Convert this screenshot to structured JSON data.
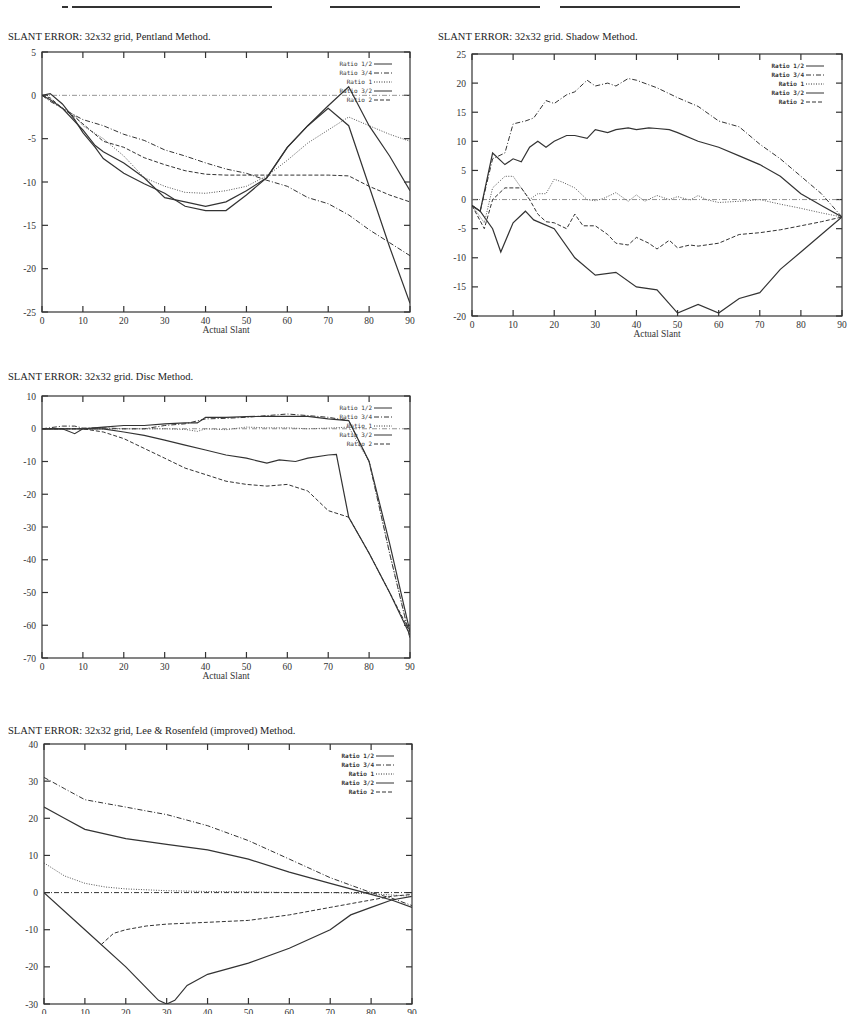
{
  "page": {
    "header_fragment": "...operated ... ... ... ... ... ... ..."
  },
  "chart_data": [
    {
      "id": "pentland",
      "type": "line",
      "title": "SLANT ERROR:  32x32 grid, Pentland Method.",
      "xlabel": "Actual Slant",
      "ylabel": "",
      "xlim": [
        0,
        90
      ],
      "ylim": [
        -25,
        5
      ],
      "xticks": [
        0,
        10,
        20,
        30,
        40,
        50,
        60,
        70,
        80,
        90
      ],
      "yticks": [
        5,
        0,
        -5,
        -10,
        -15,
        -20,
        -25
      ],
      "grid": false,
      "legend_position": "top-right",
      "series": [
        {
          "name": "Ratio 1/2",
          "style": "solid",
          "x": [
            0,
            2,
            5,
            8,
            10,
            13,
            15,
            20,
            25,
            30,
            35,
            40,
            45,
            50,
            55,
            60,
            65,
            70,
            75,
            80,
            85,
            90
          ],
          "y": [
            0,
            -0.5,
            -1.5,
            -3,
            -4,
            -5.8,
            -6.5,
            -7.8,
            -9.5,
            -11.8,
            -12.3,
            -12.8,
            -12.3,
            -11,
            -9.5,
            -6,
            -3.5,
            -1.5,
            -3.5,
            -10.5,
            -17.5,
            -24
          ]
        },
        {
          "name": "Ratio 3/4",
          "style": "dash-dot",
          "x": [
            0,
            2,
            5,
            8,
            10,
            15,
            20,
            25,
            30,
            35,
            40,
            45,
            50,
            55,
            60,
            65,
            70,
            75,
            80,
            85,
            90
          ],
          "y": [
            0,
            -0.7,
            -1.5,
            -2.3,
            -2.8,
            -3.5,
            -4.5,
            -5.2,
            -6.3,
            -7,
            -7.8,
            -8.5,
            -9,
            -9.8,
            -10.5,
            -11.8,
            -12.5,
            -13.8,
            -15.5,
            -17,
            -18.5
          ]
        },
        {
          "name": "Ratio 1",
          "style": "dotted",
          "x": [
            0,
            2,
            5,
            8,
            10,
            15,
            20,
            25,
            30,
            35,
            40,
            45,
            50,
            55,
            60,
            65,
            70,
            75,
            80,
            85,
            90
          ],
          "y": [
            0,
            -0.5,
            -1.5,
            -2.3,
            -3.5,
            -5,
            -7,
            -9.5,
            -10.5,
            -11.2,
            -11.3,
            -11,
            -10.5,
            -9.3,
            -7.5,
            -5.5,
            -4,
            -2.5,
            -3.5,
            -4.5,
            -5.3
          ]
        },
        {
          "name": "Ratio 3/2",
          "style": "solid",
          "x": [
            0,
            2,
            5,
            8,
            10,
            13,
            15,
            20,
            25,
            30,
            35,
            40,
            45,
            50,
            55,
            60,
            65,
            70,
            75,
            80,
            85,
            90
          ],
          "y": [
            0,
            0.2,
            -1,
            -2.8,
            -4.3,
            -6,
            -7.3,
            -9,
            -10.2,
            -11.3,
            -12.8,
            -13.3,
            -13.3,
            -11.5,
            -9.5,
            -6,
            -3.5,
            -1.2,
            1,
            -3.5,
            -7,
            -11
          ]
        },
        {
          "name": "Ratio 2",
          "style": "dashed",
          "x": [
            0,
            2,
            5,
            8,
            10,
            15,
            20,
            25,
            30,
            35,
            40,
            45,
            50,
            55,
            60,
            65,
            70,
            75,
            80,
            85,
            90
          ],
          "y": [
            0,
            -0.3,
            -1.5,
            -2.5,
            -3.3,
            -5.3,
            -6,
            -7.2,
            -8,
            -8.7,
            -9.1,
            -9.2,
            -9.2,
            -9.2,
            -9.2,
            -9.2,
            -9.2,
            -9.3,
            -10.5,
            -11.5,
            -12.3
          ]
        }
      ]
    },
    {
      "id": "shadow",
      "type": "line",
      "title": "SLANT ERROR:  32x32 grid. Shadow Method.",
      "xlabel": "Actual Slant",
      "ylabel": "",
      "xlim": [
        0,
        90
      ],
      "ylim": [
        -20,
        25
      ],
      "xticks": [
        0,
        10,
        20,
        30,
        40,
        50,
        60,
        70,
        80,
        90
      ],
      "yticks": [
        25,
        20,
        15,
        10,
        5,
        0,
        -5,
        -10,
        -15,
        -20
      ],
      "grid": false,
      "legend_position": "top-right",
      "series": [
        {
          "name": "Ratio 1/2",
          "style": "solid",
          "x": [
            0,
            2,
            5,
            7,
            10,
            13,
            15,
            20,
            25,
            30,
            35,
            40,
            45,
            50,
            55,
            60,
            65,
            70,
            75,
            80,
            85,
            90
          ],
          "y": [
            -1,
            -2,
            -5,
            -9,
            -4,
            -2,
            -3.5,
            -5,
            -10,
            -13,
            -12.5,
            -15,
            -15.5,
            -19.5,
            -18,
            -19.5,
            -17,
            -16,
            -12,
            -9,
            -6,
            -3
          ]
        },
        {
          "name": "Ratio 3/4",
          "style": "dash-dot",
          "x": [
            0,
            2,
            5,
            8,
            10,
            13,
            15,
            18,
            20,
            23,
            25,
            28,
            30,
            33,
            35,
            38,
            40,
            45,
            50,
            55,
            60,
            65,
            70,
            75,
            80,
            85,
            90
          ],
          "y": [
            -1,
            -2,
            7,
            8,
            13,
            13.5,
            14,
            17,
            16.5,
            18,
            18.5,
            20.5,
            19.5,
            20,
            19.5,
            20.8,
            20.5,
            19.2,
            17.5,
            16,
            13.5,
            12.5,
            9.5,
            7,
            4,
            1,
            -3
          ]
        },
        {
          "name": "Ratio 1",
          "style": "dotted",
          "x": [
            0,
            3,
            5,
            8,
            10,
            12,
            14,
            16,
            18,
            20,
            22,
            25,
            28,
            30,
            32,
            35,
            38,
            40,
            42,
            45,
            48,
            50,
            53,
            55,
            57,
            60,
            65,
            70,
            75,
            80,
            85,
            90
          ],
          "y": [
            -1,
            -4,
            2,
            4,
            4,
            2,
            0,
            1,
            1,
            3.5,
            3,
            2,
            0,
            -0.2,
            0.2,
            1.2,
            -0.3,
            0.8,
            -0.3,
            0.7,
            0,
            0.5,
            -0.1,
            0.7,
            0,
            -0.5,
            -0.3,
            0,
            -0.8,
            -1.5,
            -2.3,
            -3
          ]
        },
        {
          "name": "Ratio 3/2",
          "style": "solid",
          "x": [
            0,
            2,
            5,
            8,
            10,
            12,
            14,
            16,
            18,
            20,
            23,
            25,
            28,
            30,
            33,
            35,
            38,
            40,
            43,
            45,
            48,
            50,
            55,
            60,
            65,
            70,
            75,
            80,
            85,
            90
          ],
          "y": [
            -1,
            -2,
            8,
            6,
            7,
            6.5,
            9,
            10,
            9,
            10,
            11,
            11,
            10.5,
            12,
            11.5,
            12,
            12.3,
            12,
            12.3,
            12.2,
            12,
            11.5,
            10,
            9,
            7.5,
            6,
            4,
            1,
            -1,
            -3
          ]
        },
        {
          "name": "Ratio 2",
          "style": "dashed",
          "x": [
            0,
            3,
            5,
            8,
            10,
            12,
            14,
            16,
            18,
            20,
            23,
            25,
            27,
            30,
            33,
            35,
            38,
            40,
            43,
            45,
            48,
            50,
            53,
            55,
            60,
            65,
            70,
            75,
            80,
            85,
            90
          ],
          "y": [
            -1,
            -5,
            0,
            2,
            2,
            2,
            0,
            -2.5,
            -3.8,
            -4,
            -5,
            -2.5,
            -4.5,
            -4.5,
            -6,
            -7.5,
            -7.8,
            -6.5,
            -7.5,
            -8.5,
            -7,
            -8.3,
            -7.8,
            -8,
            -7.5,
            -6,
            -5.7,
            -5.2,
            -4.5,
            -3.8,
            -3
          ]
        }
      ]
    },
    {
      "id": "disc",
      "type": "line",
      "title": "SLANT ERROR:  32x32 grid. Disc Method.",
      "xlabel": "Actual Slant",
      "ylabel": "",
      "xlim": [
        0,
        90
      ],
      "ylim": [
        -70,
        10
      ],
      "xticks": [
        0,
        10,
        20,
        30,
        40,
        50,
        60,
        70,
        80,
        90
      ],
      "yticks": [
        10,
        0,
        -10,
        -20,
        -30,
        -40,
        -50,
        -60,
        -70
      ],
      "grid": false,
      "legend_position": "top-right",
      "series": [
        {
          "name": "Ratio 1/2",
          "style": "solid",
          "x": [
            0,
            5,
            8,
            10,
            15,
            20,
            25,
            30,
            35,
            38,
            40,
            45,
            50,
            55,
            60,
            65,
            70,
            75,
            80,
            85,
            90
          ],
          "y": [
            0,
            0,
            -1.5,
            0,
            0.5,
            1,
            1,
            1.5,
            1.8,
            1.8,
            3.5,
            3.5,
            3.7,
            3.8,
            3.8,
            3.8,
            3,
            2.5,
            -10,
            -35,
            -62
          ]
        },
        {
          "name": "Ratio 3/4",
          "style": "dash-dot",
          "x": [
            0,
            5,
            8,
            10,
            15,
            20,
            25,
            30,
            35,
            40,
            45,
            50,
            55,
            60,
            65,
            70,
            75,
            80,
            85,
            90
          ],
          "y": [
            0,
            0.8,
            0.8,
            0.2,
            0.3,
            0,
            0,
            1,
            1.5,
            3,
            3.2,
            3.5,
            4,
            4.5,
            4,
            3.5,
            2.5,
            -10,
            -38,
            -64
          ]
        },
        {
          "name": "Ratio 1",
          "style": "dotted",
          "x": [
            0,
            5,
            10,
            15,
            20,
            25,
            30,
            35,
            38,
            40,
            45,
            50,
            55,
            60,
            65,
            70,
            75,
            80,
            85,
            90
          ],
          "y": [
            0,
            0,
            0,
            0,
            0,
            0,
            0,
            -0.2,
            -0.8,
            0,
            -0.3,
            0.5,
            0.3,
            0.3,
            0,
            0.2,
            0.5,
            -10,
            -38,
            -64
          ]
        },
        {
          "name": "Ratio 3/2",
          "style": "solid",
          "x": [
            0,
            5,
            10,
            15,
            20,
            25,
            30,
            35,
            40,
            45,
            50,
            55,
            58,
            62,
            65,
            70,
            72,
            75,
            80,
            85,
            90
          ],
          "y": [
            0,
            0,
            0,
            0,
            -1,
            -2,
            -3.5,
            -5,
            -6.5,
            -8,
            -9,
            -10.5,
            -9.5,
            -10,
            -9,
            -8,
            -7.8,
            -27,
            -38,
            -50,
            -63
          ]
        },
        {
          "name": "Ratio 2",
          "style": "dashed",
          "x": [
            0,
            5,
            10,
            15,
            20,
            25,
            30,
            35,
            40,
            45,
            50,
            55,
            60,
            65,
            70,
            75,
            80,
            85,
            90
          ],
          "y": [
            0,
            0,
            0,
            -1,
            -3,
            -6,
            -9,
            -12,
            -14,
            -16,
            -17,
            -17.5,
            -17,
            -19,
            -25,
            -27,
            -38,
            -50,
            -62
          ]
        }
      ]
    },
    {
      "id": "lee-rosenfeld",
      "type": "line",
      "title": "SLANT ERROR:  32x32 grid, Lee & Rosenfeld (improved) Method.",
      "xlabel": "Actual Slant",
      "ylabel": "",
      "xlim": [
        0,
        90
      ],
      "ylim": [
        -30,
        40
      ],
      "xticks": [
        0,
        10,
        20,
        30,
        40,
        50,
        60,
        70,
        80,
        90
      ],
      "yticks": [
        40,
        30,
        20,
        10,
        0,
        -10,
        -20,
        -30
      ],
      "grid": false,
      "legend_position": "top-right",
      "series": [
        {
          "name": "Ratio 1/2",
          "style": "solid",
          "x": [
            0,
            10,
            20,
            28,
            30,
            32,
            35,
            40,
            50,
            60,
            70,
            75,
            80,
            85,
            90
          ],
          "y": [
            0,
            -10,
            -20,
            -29,
            -30,
            -29,
            -25,
            -22,
            -19,
            -15,
            -10,
            -6,
            -4,
            -2,
            -1
          ]
        },
        {
          "name": "Ratio 3/4",
          "style": "dash-dot",
          "x": [
            0,
            5,
            10,
            15,
            20,
            25,
            30,
            40,
            50,
            60,
            70,
            80,
            85,
            90
          ],
          "y": [
            31,
            28,
            25,
            24,
            23,
            22,
            21,
            18,
            14,
            9,
            4,
            0,
            -1.5,
            -3.5
          ]
        },
        {
          "name": "Ratio 1",
          "style": "dotted",
          "x": [
            0,
            5,
            10,
            15,
            20,
            30,
            40,
            50,
            60,
            70,
            80,
            90
          ],
          "y": [
            8,
            4.5,
            2.5,
            1.5,
            1,
            0.5,
            0.3,
            0.2,
            0,
            0,
            -0.3,
            -1
          ]
        },
        {
          "name": "Ratio 3/2",
          "style": "solid",
          "x": [
            0,
            5,
            10,
            20,
            30,
            40,
            50,
            60,
            70,
            80,
            85,
            90
          ],
          "y": [
            23,
            20,
            17,
            14.5,
            13,
            11.5,
            9,
            5.5,
            2.5,
            -0.5,
            -2,
            -4
          ]
        },
        {
          "name": "Ratio 2",
          "style": "dashed",
          "x": [
            14,
            17,
            20,
            25,
            30,
            40,
            50,
            60,
            70,
            80,
            85,
            90
          ],
          "y": [
            -14,
            -11,
            -10,
            -9,
            -8.5,
            -8,
            -7.5,
            -6,
            -4,
            -2,
            -1,
            -0.5
          ]
        },
        {
          "name": "baseline",
          "style": "dash-dot",
          "x": [
            0,
            90
          ],
          "y": [
            0,
            0
          ]
        }
      ]
    }
  ]
}
